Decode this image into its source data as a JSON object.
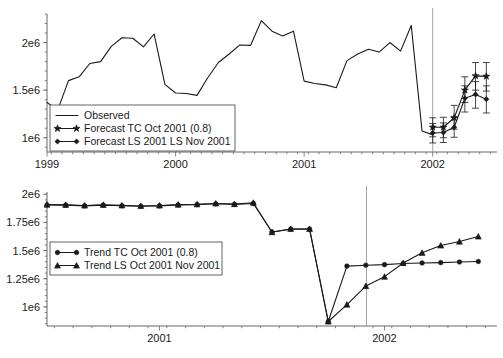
{
  "chart_data": [
    {
      "id": "forecast-panel",
      "type": "line",
      "title": "",
      "xlabel": "",
      "ylabel": "",
      "xlim": [
        1999.0,
        2002.5
      ],
      "ylim": [
        850000,
        2300000
      ],
      "xticks": [
        1999,
        2000,
        2001,
        2002
      ],
      "xtick_labels": [
        "1999",
        "2000",
        "2001",
        "2002"
      ],
      "yticks": [
        1000000,
        1500000,
        2000000
      ],
      "ytick_labels": [
        "1e6",
        "1.5e6",
        "2e6"
      ],
      "minor_tick_step": 0.0833,
      "grid": false,
      "legend_position": "lower-left",
      "forecast_divider_x": 2002.0,
      "series": [
        {
          "name": "Observed",
          "marker": "none",
          "x": [
            1999.0,
            1999.083,
            1999.167,
            1999.25,
            1999.333,
            1999.417,
            1999.5,
            1999.583,
            1999.667,
            1999.75,
            1999.833,
            1999.917,
            2000.0,
            2000.083,
            2000.167,
            2000.25,
            2000.333,
            2000.417,
            2000.5,
            2000.583,
            2000.667,
            2000.75,
            2000.833,
            2000.917,
            2001.0,
            2001.083,
            2001.167,
            2001.25,
            2001.333,
            2001.417,
            2001.5,
            2001.583,
            2001.667,
            2001.75,
            2001.833,
            2001.917,
            2002.0
          ],
          "values": [
            1370000,
            1290000,
            1600000,
            1640000,
            1780000,
            1800000,
            1960000,
            2050000,
            2045000,
            1955000,
            2090000,
            1560000,
            1470000,
            1465000,
            1445000,
            1630000,
            1790000,
            1880000,
            1975000,
            1970000,
            2230000,
            2120000,
            2070000,
            2120000,
            1595000,
            1570000,
            1555000,
            1525000,
            1810000,
            1880000,
            1930000,
            1900000,
            2000000,
            1910000,
            2180000,
            1070000,
            1030000
          ]
        },
        {
          "name": "Forecast TC Oct 2001 (0.8)",
          "marker": "star",
          "x": [
            2002.0,
            2002.083,
            2002.167,
            2002.25,
            2002.333,
            2002.417
          ],
          "values": [
            1110000,
            1110000,
            1210000,
            1500000,
            1650000,
            1645000
          ],
          "err_low": [
            1010000,
            1000000,
            1090000,
            1370000,
            1500000,
            1490000
          ],
          "err_high": [
            1210000,
            1215000,
            1340000,
            1640000,
            1790000,
            1790000
          ]
        },
        {
          "name": "Forecast LS 2001 LS Nov 2001",
          "marker": "diamond",
          "x": [
            2002.0,
            2002.083,
            2002.167,
            2002.25,
            2002.333,
            2002.417
          ],
          "values": [
            1050000,
            1055000,
            1110000,
            1415000,
            1455000,
            1405000
          ],
          "err_low": [
            945000,
            950000,
            1005000,
            1270000,
            1310000,
            1260000
          ],
          "err_high": [
            1150000,
            1155000,
            1215000,
            1545000,
            1590000,
            1545000
          ]
        }
      ]
    },
    {
      "id": "trend-panel",
      "type": "line",
      "title": "",
      "xlabel": "",
      "ylabel": "",
      "xlim": [
        2000.5,
        2002.5
      ],
      "ylim": [
        830000,
        2020000
      ],
      "xticks": [
        2001,
        2002
      ],
      "xtick_labels": [
        "2001",
        "2002"
      ],
      "yticks": [
        1000000,
        1250000,
        1500000,
        1750000,
        2000000
      ],
      "ytick_labels": [
        "1e6",
        "1.25e6",
        "1.5e6",
        "1.75e6",
        "2e6"
      ],
      "minor_tick_step": 0.0833,
      "grid": false,
      "legend_position": "middle-left",
      "forecast_divider_x": 2001.92,
      "series": [
        {
          "name": "Trend TC Oct 2001 (0.8)",
          "marker": "circle",
          "x": [
            2000.5,
            2000.583,
            2000.667,
            2000.75,
            2000.833,
            2000.917,
            2001.0,
            2001.083,
            2001.167,
            2001.25,
            2001.333,
            2001.417,
            2001.5,
            2001.583,
            2001.667,
            2001.75,
            2001.833,
            2001.917,
            2002.0,
            2002.083,
            2002.167,
            2002.25,
            2002.333,
            2002.417
          ],
          "values": [
            1905000,
            1903000,
            1897000,
            1903000,
            1898000,
            1893000,
            1897000,
            1905000,
            1908000,
            1915000,
            1910000,
            1918000,
            1665000,
            1690000,
            1690000,
            870000,
            1362000,
            1370000,
            1375000,
            1385000,
            1390000,
            1393000,
            1398000,
            1403000
          ]
        },
        {
          "name": "Trend LS Oct 2001 Nov 2001",
          "marker": "triangle",
          "x": [
            2000.5,
            2000.583,
            2000.667,
            2000.75,
            2000.833,
            2000.917,
            2001.0,
            2001.083,
            2001.167,
            2001.25,
            2001.333,
            2001.417,
            2001.5,
            2001.583,
            2001.667,
            2001.75,
            2001.833,
            2001.917,
            2002.0,
            2002.083,
            2002.167,
            2002.25,
            2002.333,
            2002.417
          ],
          "values": [
            1908000,
            1906000,
            1900000,
            1906000,
            1901000,
            1896000,
            1900000,
            1908000,
            1911000,
            1918000,
            1913000,
            1925000,
            1663000,
            1692000,
            1692000,
            870000,
            1020000,
            1185000,
            1268000,
            1390000,
            1480000,
            1545000,
            1580000,
            1625000
          ]
        }
      ]
    }
  ]
}
